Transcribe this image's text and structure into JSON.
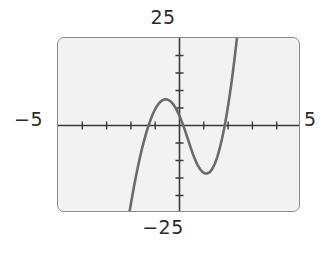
{
  "figure": {
    "kind": "graphing-calculator-screen",
    "background_color": "#f2f2f2",
    "frame_color": "#8a8a8a",
    "curve_color": "#6b6b6b",
    "axis_color": "#3a3a3a"
  },
  "labels": {
    "top": "25",
    "bottom": "−25",
    "left": "−5",
    "right": "5",
    "curve": "g"
  },
  "chart_data": {
    "type": "line",
    "title": "",
    "xlabel": "",
    "ylabel": "",
    "xlim": [
      -5,
      5
    ],
    "ylim": [
      -25,
      25
    ],
    "grid": false,
    "legend": "none",
    "axis_labels_shown": {
      "xmin": "−5",
      "xmax": "5",
      "ymin": "−25",
      "ymax": "25"
    },
    "xtick_step": 1,
    "ytick_step": 5,
    "xticks": [
      -4,
      -3,
      -2,
      -1,
      1,
      2,
      3,
      4
    ],
    "yticks": [
      -20,
      -15,
      -10,
      -5,
      5,
      10,
      15,
      20
    ],
    "series": [
      {
        "name": "g",
        "annotation": "g",
        "roots": [
          -1.55,
          0.25,
          2.4
        ],
        "local_max": [
          -0.9,
          12
        ],
        "local_min": [
          1.45,
          -11
        ],
        "x": [
          -2.05,
          -1.95,
          -1.85,
          -1.75,
          -1.65,
          -1.55,
          -1.45,
          -1.35,
          -1.25,
          -1.15,
          -1.05,
          -0.95,
          -0.85,
          -0.75,
          -0.65,
          -0.55,
          -0.45,
          -0.35,
          -0.25,
          -0.15,
          -0.05,
          0.05,
          0.15,
          0.25,
          0.35,
          0.45,
          0.55,
          0.65,
          0.75,
          0.85,
          0.95,
          1.05,
          1.15,
          1.25,
          1.35,
          1.45,
          1.55,
          1.65,
          1.75,
          1.85,
          1.95,
          2.05,
          2.15,
          2.25,
          2.35,
          2.45,
          2.55,
          2.65,
          2.72
        ],
        "y": [
          -24.4,
          -20.4,
          -16.6,
          -13.1,
          -9.8,
          -6.8,
          -4.1,
          -1.7,
          0.5,
          2.4,
          4.0,
          5.3,
          6.3,
          7.0,
          7.4,
          7.5,
          7.3,
          6.8,
          6.0,
          4.9,
          3.5,
          1.9,
          0.1,
          -1.9,
          -4.0,
          -6.1,
          -8.1,
          -9.9,
          -11.4,
          -12.5,
          -13.3,
          -13.7,
          -13.7,
          -13.3,
          -12.4,
          -11.0,
          -9.1,
          -6.7,
          -3.8,
          -0.4,
          3.5,
          7.9,
          12.8,
          18.2,
          24.1,
          30.5,
          37.4,
          44.8,
          50.3
        ]
      }
    ]
  }
}
